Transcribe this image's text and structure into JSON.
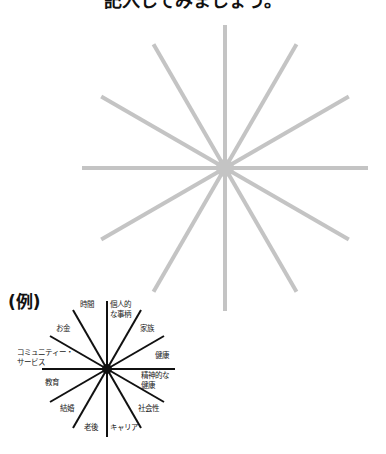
{
  "title": "記入してみましょう。",
  "example_label": "(例)",
  "large_wheel": {
    "spokes": 12,
    "color": "#c4c4c4",
    "center_x": 225,
    "center_y": 168,
    "radius": 143
  },
  "small_wheel": {
    "spokes": 12,
    "color": "#111111",
    "center_x": 107,
    "center_y": 369,
    "radius": 68,
    "labels": {
      "jikan": "時間",
      "kojin1": "個人的",
      "kojin2": "な事柄",
      "okane": "お金",
      "kazoku": "家族",
      "community1": "コミュニティー・",
      "community2": "サービス",
      "kenkou": "健康",
      "seishin1": "精神的な",
      "seishin2": "健康",
      "kyouiku": "教育",
      "kekkon": "結婚",
      "shakaisei": "社会性",
      "rougo": "老後",
      "career": "キャリア"
    }
  }
}
